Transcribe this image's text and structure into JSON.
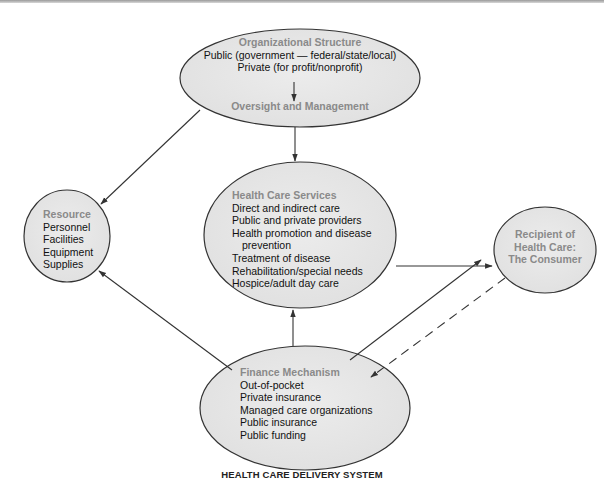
{
  "diagram": {
    "caption": "HEALTH CARE DELIVERY SYSTEM",
    "nodes": {
      "organizational_structure": {
        "title": "Organizational Structure",
        "lines": [
          "Public (government — federal/state/local)",
          "Private (for profit/nonprofit)"
        ],
        "subtitle": "Oversight and Management"
      },
      "resource": {
        "title": "Resource",
        "lines": [
          "Personnel",
          "Facilities",
          "Equipment",
          "Supplies"
        ]
      },
      "health_care_services": {
        "title": "Health Care Services",
        "lines": [
          "Direct and indirect care",
          "Public and private providers",
          "Health promotion and disease",
          "prevention",
          "Treatment of disease",
          "Rehabilitation/special needs",
          "Hospice/adult day care"
        ]
      },
      "recipient": {
        "title_lines": [
          "Recipient of",
          "Health Care:",
          "The Consumer"
        ]
      },
      "finance_mechanism": {
        "title": "Finance Mechanism",
        "lines": [
          "Out-of-pocket",
          "Private insurance",
          "Managed care organizations",
          "Public insurance",
          "Public funding"
        ]
      }
    },
    "edges": [
      {
        "from": "organizational_structure",
        "to": "resource",
        "style": "solid"
      },
      {
        "from": "organizational_structure",
        "to": "health_care_services",
        "style": "solid"
      },
      {
        "from": "health_care_services",
        "to": "recipient",
        "style": "solid"
      },
      {
        "from": "finance_mechanism",
        "to": "resource",
        "style": "solid"
      },
      {
        "from": "finance_mechanism",
        "to": "health_care_services",
        "style": "solid"
      },
      {
        "from": "finance_mechanism",
        "to": "recipient",
        "style": "solid"
      },
      {
        "from": "recipient",
        "to": "finance_mechanism",
        "style": "dashed"
      }
    ],
    "colors": {
      "node_fill": "#e6e6e6",
      "node_stroke": "#333333",
      "title_text": "#8a8a8a",
      "body_text": "#111111"
    }
  }
}
